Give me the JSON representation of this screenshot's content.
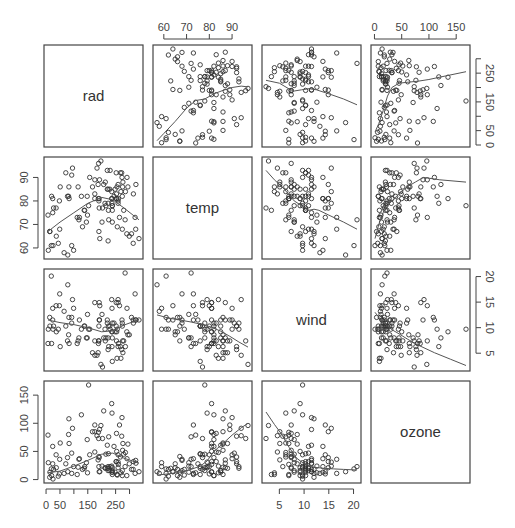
{
  "chart_data": {
    "type": "scatter",
    "title": "",
    "variables": [
      "rad",
      "temp",
      "wind",
      "ozone"
    ],
    "layout": {
      "grid": false,
      "smoother": "lowess",
      "point_shape": "open-circle"
    },
    "ranges": {
      "rad": [
        7,
        334
      ],
      "temp": [
        57,
        97
      ],
      "wind": [
        2.3,
        20.7
      ],
      "ozone": [
        1,
        168
      ]
    },
    "axis_ticks": {
      "rad": {
        "ticks": [
          0,
          50,
          100,
          150,
          200,
          250,
          300
        ],
        "labels": [
          "0",
          "50",
          "",
          "150",
          "",
          "250",
          ""
        ],
        "side": "bottom"
      },
      "temp": {
        "ticks": [
          60,
          70,
          80,
          90
        ],
        "labels": [
          "60",
          "70",
          "80",
          "90"
        ],
        "side": "top"
      },
      "wind": {
        "ticks": [
          5,
          10,
          15,
          20
        ],
        "labels": [
          "5",
          "10",
          "15",
          "20"
        ],
        "side": "bottom"
      },
      "ozone": {
        "ticks": [
          0,
          50,
          100,
          150
        ],
        "labels": [
          "0",
          "50",
          "100",
          "150"
        ],
        "side": "top"
      },
      "rad_y": {
        "ticks": [
          0,
          50,
          100,
          150,
          200,
          250,
          300
        ],
        "labels": [
          "0",
          "50",
          "",
          "150",
          "",
          "250",
          ""
        ],
        "side": "right"
      },
      "temp_y": {
        "ticks": [
          60,
          70,
          80,
          90
        ],
        "labels": [
          "60",
          "70",
          "80",
          "90"
        ],
        "side": "left"
      },
      "wind_y": {
        "ticks": [
          5,
          10,
          15,
          20
        ],
        "labels": [
          "5",
          "10",
          "15",
          "20"
        ],
        "side": "right"
      },
      "ozone_y": {
        "ticks": [
          0,
          50,
          100,
          150
        ],
        "labels": [
          "0",
          "50",
          "100",
          "150"
        ],
        "side": "left"
      }
    },
    "observations": {
      "rad": [
        190,
        118,
        149,
        313,
        299,
        99,
        19,
        256,
        290,
        274,
        65,
        334,
        307,
        78,
        322,
        44,
        8,
        320,
        25,
        92,
        13,
        252,
        223,
        279,
        127,
        291,
        323,
        148,
        191,
        284,
        37,
        120,
        137,
        269,
        248,
        236,
        175,
        314,
        276,
        267,
        272,
        175,
        264,
        175,
        48,
        260,
        274,
        285,
        187,
        220,
        7,
        294,
        223,
        81,
        82,
        213,
        275,
        253,
        254,
        83,
        24,
        77,
        255,
        229,
        207,
        192,
        273,
        157,
        71,
        51,
        115,
        244,
        190,
        259,
        36,
        212,
        238,
        215,
        153,
        203,
        225,
        237,
        188,
        167,
        197,
        183,
        189,
        95,
        92,
        252,
        220,
        230,
        259,
        236,
        259,
        238,
        24,
        112,
        237,
        224,
        27,
        238,
        201,
        238,
        14,
        139,
        49,
        20,
        193,
        145,
        191,
        131,
        223
      ],
      "temp": [
        67,
        72,
        74,
        62,
        65,
        59,
        61,
        69,
        66,
        68,
        58,
        64,
        66,
        57,
        68,
        62,
        59,
        73,
        61,
        61,
        67,
        81,
        79,
        76,
        82,
        90,
        87,
        82,
        77,
        72,
        65,
        73,
        76,
        84,
        85,
        81,
        83,
        83,
        88,
        92,
        92,
        89,
        73,
        81,
        80,
        81,
        82,
        84,
        87,
        85,
        74,
        86,
        85,
        82,
        86,
        88,
        86,
        83,
        81,
        81,
        81,
        82,
        86,
        85,
        87,
        89,
        90,
        90,
        92,
        86,
        86,
        82,
        80,
        79,
        77,
        79,
        76,
        78,
        78,
        77,
        72,
        79,
        81,
        86,
        97,
        94,
        96,
        94,
        91,
        92,
        93,
        93,
        87,
        84,
        80,
        78,
        75,
        73,
        81,
        76,
        77,
        71,
        71,
        78,
        67,
        76,
        68,
        82,
        64,
        71,
        81,
        69,
        63,
        70,
        75,
        76,
        68
      ],
      "wind": [
        7.4,
        8,
        12.6,
        11.5,
        8.6,
        13.8,
        20.1,
        9.7,
        9.2,
        10.9,
        13.2,
        11.5,
        12,
        18.4,
        11.5,
        9.7,
        9.7,
        16.6,
        9.7,
        12,
        12,
        14.9,
        5.7,
        7.4,
        9.7,
        13.8,
        11.5,
        8,
        14.9,
        20.7,
        9.2,
        11.5,
        10.3,
        4,
        9.2,
        9.2,
        4.6,
        10.9,
        5.1,
        6.3,
        5.7,
        7.4,
        14.3,
        14.9,
        14.3,
        6.9,
        10.3,
        6.3,
        5.1,
        11.5,
        6.9,
        8.6,
        8,
        8.6,
        12,
        7.4,
        7.4,
        7.4,
        9.2,
        6.9,
        13.8,
        7.4,
        4,
        10.3,
        8,
        11.5,
        11.5,
        9.7,
        10.3,
        6.3,
        7.4,
        10.9,
        10.3,
        15.5,
        14.3,
        9.7,
        3.4,
        8,
        9.7,
        2.3,
        6.3,
        6.3,
        6.9,
        5.1,
        2.8,
        4.6,
        7.4,
        15.5,
        10.9,
        10.3,
        10.9,
        9.7,
        14.9,
        15.5,
        6.3,
        10.9,
        11.5,
        6.9,
        13.8,
        10.3,
        10.3,
        8,
        12.6,
        9.2,
        10.3,
        10.3,
        16.6,
        6.9,
        14.3,
        8,
        11.5
      ],
      "ozone": [
        41,
        36,
        12,
        18,
        28,
        23,
        19,
        8,
        7,
        16,
        11,
        14,
        18,
        14,
        34,
        6,
        30,
        11,
        1,
        11,
        4,
        32,
        23,
        45,
        115,
        37,
        29,
        71,
        39,
        23,
        21,
        37,
        20,
        12,
        13,
        135,
        49,
        32,
        64,
        40,
        77,
        97,
        97,
        85,
        10,
        27,
        7,
        48,
        35,
        61,
        79,
        63,
        16,
        80,
        108,
        20,
        52,
        82,
        50,
        64,
        59,
        39,
        9,
        16,
        122,
        89,
        110,
        44,
        28,
        65,
        22,
        59,
        23,
        31,
        44,
        21,
        9,
        45,
        168,
        73,
        76,
        118,
        84,
        85,
        96,
        78,
        73,
        91,
        47,
        32,
        20,
        23,
        21,
        24,
        44,
        21,
        28,
        9,
        13,
        46,
        18,
        13,
        24,
        16,
        13,
        23,
        36,
        7,
        14,
        30,
        14,
        18,
        20
      ]
    },
    "panels": [
      {
        "row": "rad",
        "col": "temp",
        "smoother": [
          [
            57,
            15
          ],
          [
            60,
            40
          ],
          [
            65,
            82
          ],
          [
            70,
            128
          ],
          [
            74,
            155
          ],
          [
            78,
            160
          ],
          [
            82,
            178
          ],
          [
            86,
            190
          ],
          [
            90,
            200
          ],
          [
            94,
            205
          ],
          [
            97,
            202
          ]
        ]
      },
      {
        "row": "rad",
        "col": "wind",
        "smoother": [
          [
            2.3,
            225
          ],
          [
            5,
            215
          ],
          [
            7,
            195
          ],
          [
            8,
            188
          ],
          [
            9.5,
            192
          ],
          [
            11,
            196
          ],
          [
            12.5,
            192
          ],
          [
            15,
            178
          ],
          [
            18,
            160
          ],
          [
            20.7,
            140
          ]
        ]
      },
      {
        "row": "rad",
        "col": "ozone",
        "smoother": [
          [
            1,
            45
          ],
          [
            8,
            75
          ],
          [
            16,
            120
          ],
          [
            24,
            170
          ],
          [
            32,
            200
          ],
          [
            45,
            215
          ],
          [
            60,
            218
          ],
          [
            80,
            222
          ],
          [
            100,
            228
          ],
          [
            130,
            240
          ],
          [
            168,
            255
          ]
        ]
      },
      {
        "row": "temp",
        "col": "rad",
        "smoother": [
          [
            7,
            67
          ],
          [
            50,
            71
          ],
          [
            100,
            75
          ],
          [
            150,
            79
          ],
          [
            200,
            81.5
          ],
          [
            240,
            80.5
          ],
          [
            280,
            77
          ],
          [
            334,
            72
          ]
        ]
      },
      {
        "row": "temp",
        "col": "wind",
        "smoother": [
          [
            2.3,
            93
          ],
          [
            4,
            89
          ],
          [
            6,
            85
          ],
          [
            8,
            80
          ],
          [
            9.5,
            78
          ],
          [
            11,
            76
          ],
          [
            12,
            76.5
          ],
          [
            13,
            76
          ],
          [
            15,
            74
          ],
          [
            18,
            71
          ],
          [
            20.7,
            68
          ]
        ]
      },
      {
        "row": "temp",
        "col": "ozone",
        "smoother": [
          [
            1,
            64
          ],
          [
            8,
            70
          ],
          [
            16,
            75
          ],
          [
            24,
            78
          ],
          [
            32,
            80
          ],
          [
            45,
            83
          ],
          [
            60,
            86
          ],
          [
            75,
            88
          ],
          [
            90,
            90
          ],
          [
            120,
            89
          ],
          [
            168,
            88
          ]
        ]
      },
      {
        "row": "wind",
        "col": "rad",
        "smoother": [
          [
            7,
            11.5
          ],
          [
            50,
            11
          ],
          [
            100,
            10.6
          ],
          [
            150,
            10
          ],
          [
            200,
            9.2
          ],
          [
            240,
            9.4
          ],
          [
            280,
            10.5
          ],
          [
            334,
            11.6
          ]
        ]
      },
      {
        "row": "wind",
        "col": "temp",
        "smoother": [
          [
            57,
            12.5
          ],
          [
            62,
            11.9
          ],
          [
            67,
            11.5
          ],
          [
            72,
            11.1
          ],
          [
            77,
            10.6
          ],
          [
            81,
            10.1
          ],
          [
            85,
            9.3
          ],
          [
            89,
            8.3
          ],
          [
            93,
            7.2
          ],
          [
            97,
            6.2
          ]
        ]
      },
      {
        "row": "wind",
        "col": "ozone",
        "smoother": [
          [
            1,
            13
          ],
          [
            8,
            12
          ],
          [
            16,
            11
          ],
          [
            24,
            10.3
          ],
          [
            32,
            9.6
          ],
          [
            45,
            8.8
          ],
          [
            60,
            7.8
          ],
          [
            80,
            6.6
          ],
          [
            110,
            5.1
          ],
          [
            140,
            3.8
          ],
          [
            168,
            2.6
          ]
        ]
      },
      {
        "row": "ozone",
        "col": "rad",
        "smoother": [
          [
            7,
            12
          ],
          [
            50,
            15
          ],
          [
            100,
            24
          ],
          [
            150,
            34
          ],
          [
            200,
            45
          ],
          [
            240,
            47
          ],
          [
            280,
            38
          ],
          [
            334,
            29
          ]
        ]
      },
      {
        "row": "ozone",
        "col": "temp",
        "smoother": [
          [
            57,
            8
          ],
          [
            62,
            10
          ],
          [
            67,
            13
          ],
          [
            72,
            18
          ],
          [
            76,
            24
          ],
          [
            79,
            33
          ],
          [
            82,
            50
          ],
          [
            86,
            64
          ],
          [
            90,
            79
          ],
          [
            94,
            92
          ],
          [
            97,
            100
          ]
        ]
      },
      {
        "row": "ozone",
        "col": "wind",
        "smoother": [
          [
            2.3,
            120
          ],
          [
            4,
            98
          ],
          [
            5.5,
            80
          ],
          [
            7,
            57
          ],
          [
            8.5,
            38
          ],
          [
            10,
            28
          ],
          [
            12,
            22
          ],
          [
            14,
            20
          ],
          [
            16,
            19
          ],
          [
            18,
            18
          ],
          [
            20.7,
            17
          ]
        ]
      }
    ]
  },
  "diagonal_labels": [
    "rad",
    "temp",
    "wind",
    "ozone"
  ],
  "colors": {
    "points": "#333333",
    "line": "#555555",
    "frame": "#444444",
    "text": "#444444"
  }
}
